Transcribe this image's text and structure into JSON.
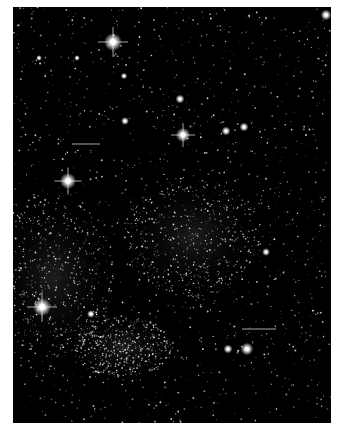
{
  "image": {
    "subject": "Star field photograph",
    "background_color": "#000000",
    "border_color": "#ffffff",
    "frame": {
      "x": 13,
      "y": 7,
      "width": 318,
      "height": 416
    }
  },
  "bright_stars": [
    {
      "x": 113,
      "y": 42,
      "r": 5,
      "spikes": true
    },
    {
      "x": 326,
      "y": 15,
      "r": 3,
      "spikes": false
    },
    {
      "x": 68,
      "y": 181,
      "r": 4.5,
      "spikes": true
    },
    {
      "x": 183,
      "y": 135,
      "r": 4,
      "spikes": true
    },
    {
      "x": 180,
      "y": 99,
      "r": 2.5,
      "spikes": false
    },
    {
      "x": 226,
      "y": 131,
      "r": 2.5,
      "spikes": false
    },
    {
      "x": 244,
      "y": 127,
      "r": 2.5,
      "spikes": false
    },
    {
      "x": 125,
      "y": 121,
      "r": 2.2,
      "spikes": false
    },
    {
      "x": 124,
      "y": 76,
      "r": 1.8,
      "spikes": false
    },
    {
      "x": 77,
      "y": 58,
      "r": 1.6,
      "spikes": false
    },
    {
      "x": 39,
      "y": 58,
      "r": 1.6,
      "spikes": false
    },
    {
      "x": 42,
      "y": 307,
      "r": 5,
      "spikes": true
    },
    {
      "x": 247,
      "y": 349,
      "r": 3.5,
      "spikes": false
    },
    {
      "x": 228,
      "y": 349,
      "r": 2.5,
      "spikes": false
    },
    {
      "x": 91,
      "y": 314,
      "r": 2.2,
      "spikes": false
    },
    {
      "x": 266,
      "y": 252,
      "r": 2.2,
      "spikes": false
    }
  ],
  "streaks": [
    {
      "x": 72,
      "y": 144,
      "width": 28
    },
    {
      "x": 242,
      "y": 329,
      "width": 34
    }
  ],
  "dense_regions": [
    {
      "cx": 40,
      "cy": 270,
      "rx": 60,
      "ry": 80
    },
    {
      "cx": 110,
      "cy": 340,
      "rx": 50,
      "ry": 30
    },
    {
      "cx": 180,
      "cy": 230,
      "rx": 70,
      "ry": 60
    }
  ]
}
